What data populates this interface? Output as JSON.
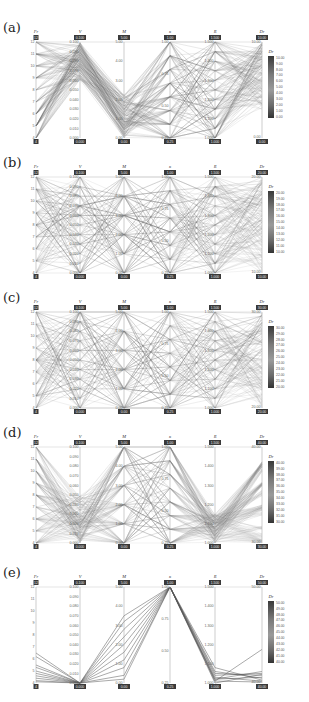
{
  "axes": [
    {
      "name": "Fr",
      "ticks": [
        "12",
        "11",
        "10",
        "9",
        "8",
        "7",
        "6",
        "5",
        "4"
      ]
    },
    {
      "name": "V",
      "ticks": [
        "0.100",
        "0.090",
        "0.080",
        "0.070",
        "0.060",
        "0.050",
        "0.040",
        "0.030",
        "0.020",
        "0.010",
        "0.000"
      ]
    },
    {
      "name": "M",
      "ticks": [
        "5.00",
        "4.00",
        "3.00",
        "2.00",
        "1.00",
        "0.00"
      ]
    },
    {
      "name": "κ",
      "ticks": [
        "1.00",
        "0.75",
        "0.50",
        "0.25"
      ]
    },
    {
      "name": "R",
      "ticks": [
        "1.500",
        "1.400",
        "1.300",
        "1.200",
        "1.100",
        "1.000"
      ]
    },
    {
      "name": "Dr",
      "ticks": []
    }
  ],
  "panels": [
    {
      "label": "(a)",
      "dr_range": [
        0,
        10
      ],
      "legend_title": "Dr",
      "legend_ticks": [
        "10.00",
        "9.00",
        "8.00",
        "7.00",
        "6.00",
        "5.00",
        "4.00",
        "3.00",
        "2.00",
        "1.00",
        "0.00"
      ],
      "header_values": [
        "12",
        "0.100",
        "5.00",
        "1.00",
        "1.500",
        "10.00"
      ],
      "footer_values": [
        "4",
        "0.000",
        "0.00",
        "0.25",
        "1.000",
        "0.00"
      ]
    },
    {
      "label": "(b)",
      "dr_range": [
        10,
        20
      ],
      "legend_title": "Dr",
      "legend_ticks": [
        "20.00",
        "19.00",
        "18.00",
        "17.00",
        "16.00",
        "15.00",
        "14.00",
        "13.00",
        "12.00",
        "11.00",
        "10.00"
      ],
      "header_values": [
        "12",
        "0.100",
        "5.00",
        "1.00",
        "1.500",
        "20.00"
      ],
      "footer_values": [
        "4",
        "0.000",
        "0.00",
        "0.25",
        "1.000",
        "10.00"
      ]
    },
    {
      "label": "(c)",
      "dr_range": [
        20,
        30
      ],
      "legend_title": "Dr",
      "legend_ticks": [
        "30.00",
        "29.00",
        "28.00",
        "27.00",
        "26.00",
        "25.00",
        "24.00",
        "23.00",
        "22.00",
        "21.00",
        "20.00"
      ],
      "header_values": [
        "12",
        "0.100",
        "5.00",
        "1.00",
        "1.500",
        "30.00"
      ],
      "footer_values": [
        "4",
        "0.000",
        "0.00",
        "0.25",
        "1.000",
        "20.00"
      ]
    },
    {
      "label": "(d)",
      "dr_range": [
        30,
        40
      ],
      "legend_title": "Dr",
      "legend_ticks": [
        "40.00",
        "39.00",
        "38.00",
        "37.00",
        "36.00",
        "35.00",
        "34.00",
        "33.00",
        "32.00",
        "31.00",
        "30.00"
      ],
      "header_values": [
        "12",
        "0.100",
        "5.00",
        "1.00",
        "1.500",
        "40.00"
      ],
      "footer_values": [
        "4",
        "0.000",
        "0.00",
        "0.25",
        "1.000",
        "30.00"
      ]
    },
    {
      "label": "(e)",
      "dr_range": [
        40,
        50
      ],
      "legend_title": "Dr",
      "legend_ticks": [
        "50.00",
        "49.00",
        "48.00",
        "47.00",
        "46.00",
        "45.00",
        "44.00",
        "43.00",
        "42.00",
        "41.00",
        "40.00"
      ],
      "header_values": [
        "12",
        "0.100",
        "5.00",
        "1.00",
        "1.500",
        "50.00"
      ],
      "footer_values": [
        "4",
        "0.000",
        "0.00",
        "0.25",
        "1.000",
        "40.00"
      ]
    }
  ],
  "chart_data": {
    "type": "parallel_coordinates",
    "title": "",
    "dimensions": [
      "Fr",
      "V",
      "M",
      "κ",
      "R",
      "Dr"
    ],
    "ranges": {
      "Fr": [
        4,
        12
      ],
      "V": [
        0,
        0.1
      ],
      "M": [
        0,
        5
      ],
      "κ": [
        0.25,
        1.0
      ],
      "R": [
        1.0,
        1.5
      ]
    },
    "panels": [
      {
        "label": "(a)",
        "Dr_range": [
          0,
          10
        ],
        "density": "dense",
        "note": "many lines; V concentrated 0.07-0.10, M low 0-2, κ spread, R spread"
      },
      {
        "label": "(b)",
        "Dr_range": [
          10,
          20
        ],
        "density": "dense",
        "note": "lines spread across all axes"
      },
      {
        "label": "(c)",
        "Dr_range": [
          20,
          30
        ],
        "density": "dense",
        "note": "lines spread across all axes"
      },
      {
        "label": "(d)",
        "Dr_range": [
          30,
          40
        ],
        "density": "dense",
        "note": "Fr mostly high, V low, R near 1.0-1.1"
      },
      {
        "label": "(e)",
        "Dr_range": [
          40,
          50
        ],
        "density": "sparse",
        "series": [
          {
            "Fr": 6.5,
            "V": 0.0,
            "M": 3.5,
            "κ": 1.0,
            "R": 1.08,
            "Dr": 40.3
          },
          {
            "Fr": 6.2,
            "V": 0.0,
            "M": 3.2,
            "κ": 1.0,
            "R": 1.06,
            "Dr": 40.5
          },
          {
            "Fr": 5.5,
            "V": 0.0,
            "M": 2.8,
            "κ": 1.0,
            "R": 1.05,
            "Dr": 40.8
          },
          {
            "Fr": 5.3,
            "V": 0.0,
            "M": 2.4,
            "κ": 1.0,
            "R": 1.04,
            "Dr": 41.0
          },
          {
            "Fr": 5.0,
            "V": 0.0,
            "M": 2.0,
            "κ": 1.0,
            "R": 1.03,
            "Dr": 40.2
          },
          {
            "Fr": 4.8,
            "V": 0.0,
            "M": 1.6,
            "κ": 1.0,
            "R": 1.02,
            "Dr": 40.6
          },
          {
            "Fr": 4.6,
            "V": 0.0,
            "M": 1.2,
            "κ": 1.0,
            "R": 1.02,
            "Dr": 41.2
          },
          {
            "Fr": 4.4,
            "V": 0.0,
            "M": 0.8,
            "κ": 1.0,
            "R": 1.01,
            "Dr": 43.5
          },
          {
            "Fr": 4.2,
            "V": 0.0,
            "M": 0.4,
            "κ": 1.0,
            "R": 1.01,
            "Dr": 40.1
          },
          {
            "Fr": 4.1,
            "V": 0.0,
            "M": 0.2,
            "κ": 1.0,
            "R": 1.0,
            "Dr": 40.9
          }
        ]
      }
    ],
    "legend_position": "right",
    "grid": false
  }
}
